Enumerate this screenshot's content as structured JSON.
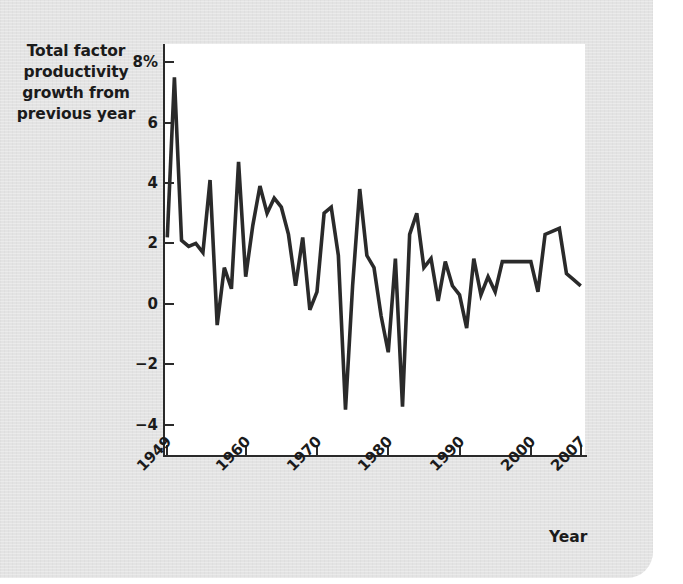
{
  "chart_data": {
    "type": "line",
    "title": "",
    "ylabel_lines": [
      "Total factor",
      "productivity",
      "growth from",
      "previous year"
    ],
    "xlabel": "Year",
    "ylim": [
      -5.0,
      8.6
    ],
    "xlim": [
      1948.4,
      2007.6
    ],
    "grid": false,
    "legend": null,
    "y_ticks": [
      {
        "value": 8,
        "label": "8%"
      },
      {
        "value": 6,
        "label": "6"
      },
      {
        "value": 4,
        "label": "4"
      },
      {
        "value": 2,
        "label": "2"
      },
      {
        "value": 0,
        "label": "0"
      },
      {
        "value": -2,
        "label": "−2"
      },
      {
        "value": -4,
        "label": "−4"
      }
    ],
    "x_ticks": [
      {
        "value": 1949,
        "label": "1949"
      },
      {
        "value": 1960,
        "label": "1960"
      },
      {
        "value": 1970,
        "label": "1970"
      },
      {
        "value": 1980,
        "label": "1980"
      },
      {
        "value": 1990,
        "label": "1990"
      },
      {
        "value": 2000,
        "label": "2000"
      },
      {
        "value": 2007,
        "label": "2007"
      }
    ],
    "series_name": "Total factor productivity growth",
    "series_color": "#2a2a2a",
    "x": [
      1949,
      1950,
      1951,
      1952,
      1953,
      1954,
      1955,
      1956,
      1957,
      1958,
      1959,
      1960,
      1961,
      1962,
      1963,
      1964,
      1965,
      1966,
      1967,
      1968,
      1969,
      1970,
      1971,
      1972,
      1973,
      1974,
      1975,
      1976,
      1977,
      1978,
      1979,
      1980,
      1981,
      1982,
      1983,
      1984,
      1985,
      1986,
      1987,
      1988,
      1989,
      1990,
      1991,
      1992,
      1993,
      1994,
      1995,
      1996,
      1997,
      1998,
      1999,
      2000,
      2001,
      2002,
      2003,
      2004,
      2005,
      2006,
      2007
    ],
    "values": [
      2.2,
      7.5,
      2.1,
      1.9,
      2.0,
      1.7,
      4.1,
      -0.7,
      1.2,
      0.5,
      4.7,
      0.9,
      2.6,
      3.9,
      3.0,
      3.5,
      3.2,
      2.3,
      0.6,
      2.2,
      -0.2,
      0.4,
      3.0,
      3.2,
      1.6,
      -3.5,
      0.6,
      3.8,
      1.6,
      1.2,
      -0.4,
      -1.6,
      1.5,
      -3.4,
      2.3,
      3.0,
      1.2,
      1.5,
      0.1,
      1.4,
      0.6,
      0.3,
      -0.8,
      1.5,
      0.3,
      0.9,
      0.4,
      1.4,
      1.4,
      1.4,
      1.4,
      1.4,
      0.4,
      2.3,
      2.4,
      2.5,
      1.0,
      0.8,
      0.6
    ]
  }
}
